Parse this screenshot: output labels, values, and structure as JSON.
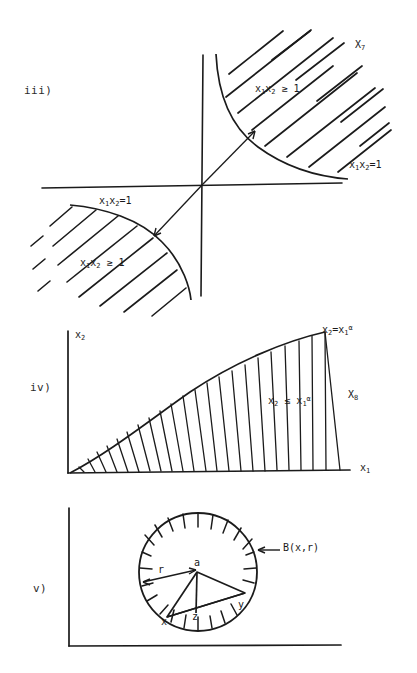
{
  "page": {
    "background": "#ffffff",
    "ink": "#1b1b1b"
  },
  "figures": [
    {
      "id": "fig-iii",
      "enumerator": "iii)",
      "set_name": "X",
      "set_index": "7",
      "set_label": "X7",
      "description": "Two branches of the hyperbola x1x2=1 in the first and third quadrants with the regions beyond them hatched.",
      "axes": {
        "horizontal": true,
        "vertical": true,
        "origin_shown": true
      },
      "labels": {
        "region_first_quadrant": "x1x2 ≥ 1",
        "curve_first_quadrant": "x1x2=1",
        "region_third_quadrant": "x1x2 ≥ 1",
        "curve_third_quadrant": "x1x2=1",
        "set": "X7"
      },
      "annotations": {
        "arrow_up_right": "arrow from origin to upper hyperbola branch",
        "arrow_down_left": "arrow from origin to lower hyperbola branch"
      }
    },
    {
      "id": "fig-iv",
      "enumerator": "iv)",
      "set_name": "X",
      "set_index": "8",
      "set_label": "X8",
      "description": "Region under the curve x2 = x1^alpha in the first quadrant, hatched with vertical strokes.",
      "axes": {
        "x_label": "x1",
        "y_label": "x2"
      },
      "labels": {
        "curve": "x2=x1ᵅ",
        "region": "x2 ≤ x1ᵅ",
        "set": "X8",
        "x_axis": "x1",
        "y_axis": "x2"
      }
    },
    {
      "id": "fig-v",
      "enumerator": "v)",
      "description": "An open ball B(x,r) drawn as a hatched circle containing points a, x, y, z with radius r marked.",
      "axes": {
        "horizontal": true,
        "vertical": true
      },
      "labels": {
        "ball": "B(x,r)",
        "radius": "r",
        "point_a": "a",
        "point_x": "x",
        "point_y": "y",
        "point_z": "z"
      }
    }
  ],
  "text": {
    "iii_enum": "iii)",
    "iv_enum": "iv)",
    "v_enum": "v)",
    "x7": "X",
    "x7_sub": "7",
    "x8": "X",
    "x8_sub": "8",
    "x_sym": "x",
    "sub1": "1",
    "sub2": "2",
    "eq1": "=1",
    "ge1": "≥ 1",
    "le": "≤",
    "alpha": "α",
    "eq": "=",
    "ball": "B(x,r)",
    "r": "r",
    "a": "a",
    "x": "x",
    "y": "y",
    "z": "z"
  }
}
